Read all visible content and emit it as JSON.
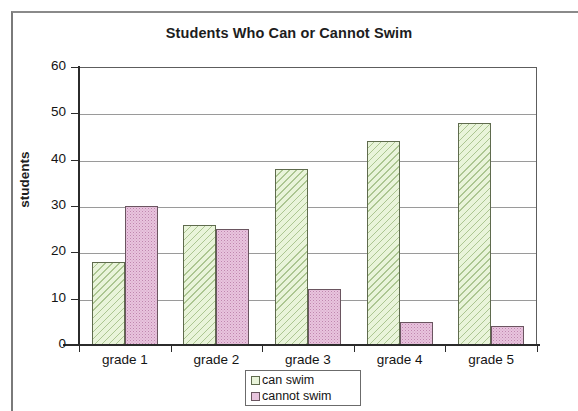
{
  "chart_data": {
    "type": "bar",
    "title": "Students Who Can or Cannot Swim",
    "xlabel": "",
    "ylabel": "students",
    "categories": [
      "grade 1",
      "grade 2",
      "grade 3",
      "grade 4",
      "grade 5"
    ],
    "series": [
      {
        "name": "can swim",
        "color": "#e9f4da",
        "values": [
          18,
          26,
          38,
          44,
          48
        ]
      },
      {
        "name": "cannot swim",
        "color": "#e8c4de",
        "values": [
          30,
          25,
          12,
          5,
          4
        ]
      }
    ],
    "ylim": [
      0,
      60
    ],
    "ytick_labels": [
      "0",
      "10",
      "20",
      "30",
      "40",
      "50",
      "60"
    ],
    "ytick_values": [
      0,
      10,
      20,
      30,
      40,
      50,
      60
    ],
    "grid": true,
    "legend_position": "bottom-center"
  },
  "legend": {
    "items": [
      {
        "label": "can swim"
      },
      {
        "label": "cannot swim"
      }
    ]
  }
}
